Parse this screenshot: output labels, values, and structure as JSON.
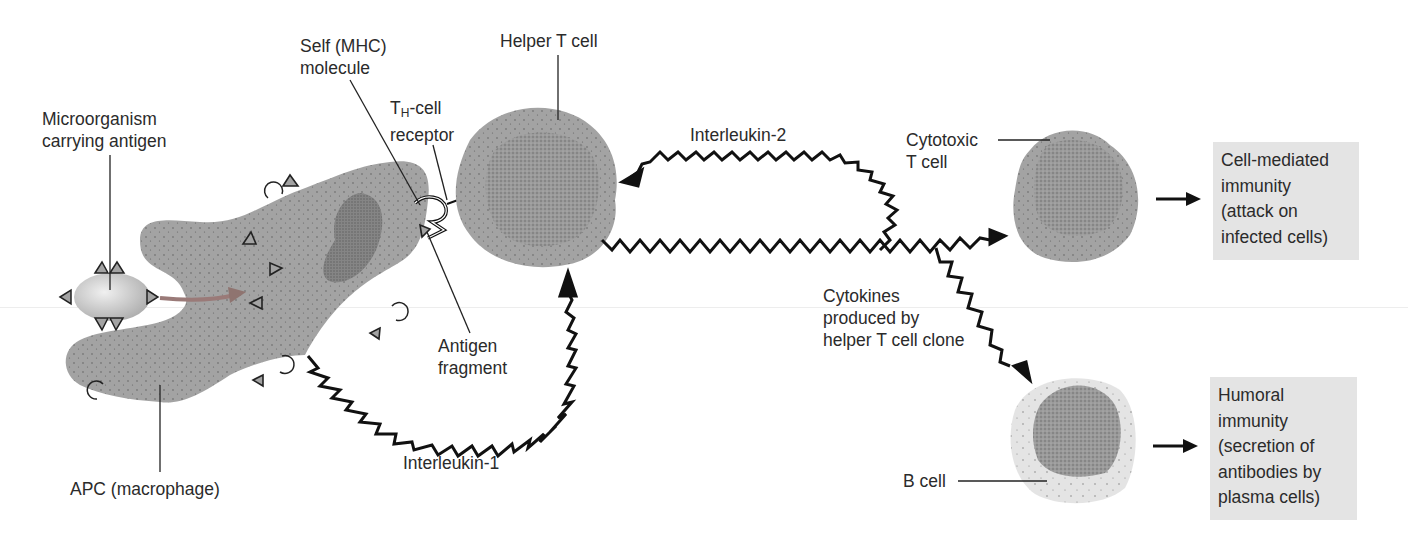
{
  "diagram": {
    "colors": {
      "cell_fill": "#a3a3a3",
      "nucleus_fill": "#8a8a8a",
      "b_cell_cytoplasm": "#e2e2e2",
      "microorganism": "#cfcfcf",
      "uptake_arrow": "#9a7a78",
      "zigzag": "#111111",
      "outcome_box": "#e4e4e4",
      "text": "#2b2b2b"
    },
    "labels": {
      "microorganism": [
        "Microorganism",
        "carrying antigen"
      ],
      "self_mhc": [
        "Self (MHC)",
        "molecule"
      ],
      "th_receptor_prefix": "T",
      "th_receptor_sub": "H",
      "th_receptor_suffix": "-cell",
      "th_receptor_line2": "receptor",
      "helper_t_cell": "Helper T cell",
      "interleukin_2": "Interleukin-2",
      "cytotoxic_t_cell": [
        "Cytotoxic",
        "T cell"
      ],
      "antigen_fragment": [
        "Antigen",
        "fragment"
      ],
      "interleukin_1": "Interleukin-1",
      "apc": "APC (macrophage)",
      "cytokines": [
        "Cytokines",
        "produced by",
        "helper T cell clone"
      ],
      "b_cell": "B cell"
    },
    "outcomes": {
      "cell_mediated": [
        "Cell-mediated",
        "immunity",
        "(attack on",
        "infected cells)"
      ],
      "humoral": [
        "Humoral",
        "immunity",
        "(secretion of",
        "antibodies by",
        "plasma cells)"
      ]
    }
  }
}
